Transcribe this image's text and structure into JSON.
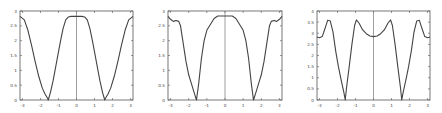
{
  "chart_data": [
    {
      "type": "line",
      "title": "",
      "xlabel": "",
      "ylabel": "",
      "xlim": [
        -3.14,
        3.14
      ],
      "ylim": [
        0,
        3
      ],
      "grid": false,
      "legend": null,
      "annotations": [
        "vertical line at x=0"
      ],
      "xticks": [
        "-3",
        "-2",
        "-1",
        "0",
        "1",
        "2",
        "3"
      ],
      "yticks": [
        "0",
        "0.5",
        "1",
        "1.5",
        "2",
        "2.5",
        "3"
      ],
      "box": {
        "x0": 20,
        "x1": 133,
        "y0": 11,
        "y1": 100
      },
      "series": [
        {
          "name": "curve",
          "x": [
            -3.14,
            -2.9,
            -2.7,
            -2.5,
            -2.3,
            -2.1,
            -1.9,
            -1.75,
            -1.6,
            -1.57,
            -1.45,
            -1.3,
            -1.1,
            -0.9,
            -0.75,
            -0.6,
            -0.45,
            -0.3,
            0,
            0.3,
            0.45,
            0.6,
            0.75,
            0.9,
            1.1,
            1.3,
            1.45,
            1.57,
            1.6,
            1.75,
            1.9,
            2.1,
            2.3,
            2.5,
            2.7,
            2.9,
            3.14
          ],
          "values": [
            2.82,
            2.7,
            2.35,
            1.85,
            1.3,
            0.8,
            0.4,
            0.2,
            0.05,
            0.0,
            0.25,
            0.65,
            1.3,
            1.95,
            2.4,
            2.7,
            2.8,
            2.82,
            2.82,
            2.82,
            2.8,
            2.7,
            2.4,
            1.95,
            1.3,
            0.65,
            0.25,
            0.0,
            0.05,
            0.2,
            0.4,
            0.8,
            1.3,
            1.85,
            2.35,
            2.7,
            2.82
          ]
        }
      ]
    },
    {
      "type": "line",
      "title": "",
      "xlabel": "",
      "ylabel": "",
      "xlim": [
        -3.14,
        3.14
      ],
      "ylim": [
        0,
        3
      ],
      "grid": false,
      "legend": null,
      "annotations": [
        "vertical line at x=0"
      ],
      "xticks": [
        "-3",
        "-2",
        "-1",
        "0",
        "1",
        "2",
        "3"
      ],
      "yticks": [
        "0",
        "0.5",
        "1",
        "1.5",
        "2",
        "2.5",
        "3"
      ],
      "box": {
        "x0": 168,
        "x1": 282,
        "y0": 11,
        "y1": 100
      },
      "series": [
        {
          "name": "curve",
          "x": [
            -3.14,
            -3.0,
            -2.85,
            -2.7,
            -2.55,
            -2.45,
            -2.3,
            -2.15,
            -2.0,
            -1.85,
            -1.7,
            -1.57,
            -1.45,
            -1.3,
            -1.15,
            -1.0,
            -0.85,
            -0.6,
            -0.4,
            -0.2,
            0,
            0.2,
            0.4,
            0.6,
            0.85,
            1.0,
            1.15,
            1.3,
            1.45,
            1.57,
            1.7,
            1.85,
            2.0,
            2.15,
            2.3,
            2.45,
            2.55,
            2.7,
            2.85,
            3.0,
            3.14
          ],
          "values": [
            2.82,
            2.72,
            2.65,
            2.68,
            2.65,
            2.5,
            1.9,
            1.3,
            0.85,
            0.55,
            0.25,
            0.0,
            0.55,
            1.4,
            2.0,
            2.35,
            2.5,
            2.75,
            2.83,
            2.83,
            2.83,
            2.83,
            2.83,
            2.75,
            2.5,
            2.35,
            2.0,
            1.4,
            0.55,
            0.0,
            0.25,
            0.55,
            0.85,
            1.3,
            1.9,
            2.5,
            2.65,
            2.68,
            2.65,
            2.72,
            2.82
          ]
        }
      ]
    },
    {
      "type": "line",
      "title": "",
      "xlabel": "",
      "ylabel": "",
      "xlim": [
        -3.14,
        3.14
      ],
      "ylim": [
        0,
        4
      ],
      "grid": false,
      "legend": null,
      "annotations": [
        "vertical line at x=0"
      ],
      "xticks": [
        "-3",
        "-2",
        "-1",
        "0",
        "1",
        "2",
        "3"
      ],
      "yticks": [
        "0",
        "0.5",
        "1",
        "1.5",
        "2",
        "2.5",
        "3",
        "3.5",
        "4"
      ],
      "box": {
        "x0": 317,
        "x1": 430,
        "y0": 11,
        "y1": 100
      },
      "series": [
        {
          "name": "curve",
          "x": [
            -3.14,
            -3.0,
            -2.85,
            -2.7,
            -2.55,
            -2.4,
            -2.25,
            -2.1,
            -1.95,
            -1.8,
            -1.65,
            -1.57,
            -1.5,
            -1.35,
            -1.2,
            -1.05,
            -0.95,
            -0.8,
            -0.6,
            -0.4,
            -0.2,
            0,
            0.2,
            0.4,
            0.6,
            0.8,
            0.95,
            1.05,
            1.2,
            1.35,
            1.5,
            1.57,
            1.65,
            1.8,
            1.95,
            2.1,
            2.25,
            2.4,
            2.55,
            2.7,
            2.85,
            3.0,
            3.14
          ],
          "values": [
            2.83,
            2.8,
            2.85,
            3.2,
            3.58,
            3.55,
            3.05,
            2.2,
            1.5,
            0.9,
            0.35,
            0.0,
            0.55,
            1.5,
            2.5,
            3.35,
            3.6,
            3.45,
            3.15,
            2.98,
            2.88,
            2.85,
            2.88,
            2.98,
            3.15,
            3.45,
            3.6,
            3.35,
            2.5,
            1.5,
            0.55,
            0.0,
            0.35,
            0.9,
            1.5,
            2.2,
            3.05,
            3.55,
            3.58,
            3.2,
            2.85,
            2.8,
            2.83
          ]
        }
      ]
    }
  ]
}
